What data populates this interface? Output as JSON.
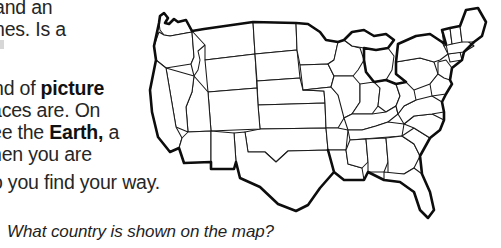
{
  "page": {
    "background_color": "#ffffff",
    "text_color": "#262626"
  },
  "passage": {
    "clipped_top_lines": [
      "and an",
      "nes. Is a"
    ],
    "lines": [
      {
        "id": "line-1",
        "segments": [
          {
            "text": "nd of ",
            "bold": false
          },
          {
            "text": "picture",
            "bold": true
          }
        ]
      },
      {
        "id": "line-2",
        "segments": [
          {
            "text": "aces are. On",
            "bold": false
          }
        ]
      },
      {
        "id": "line-3",
        "segments": [
          {
            "text": "ee the ",
            "bold": false
          },
          {
            "text": "Earth,",
            "bold": true
          },
          {
            "text": " a",
            "bold": false
          }
        ]
      },
      {
        "id": "line-4",
        "segments": [
          {
            "text": "hen you are",
            "bold": false
          }
        ]
      },
      {
        "id": "line-5",
        "segments": [
          {
            "text": "o you find your way.",
            "bold": false
          }
        ]
      }
    ],
    "line_top_1": "and an",
    "line_top_2": "nes. Is a",
    "line_1_a": "nd of ",
    "line_1_bold": "picture",
    "line_2": "aces are. On",
    "line_3_a": "ee the ",
    "line_3_bold": "Earth,",
    "line_3_b": " a",
    "line_4": "hen you are",
    "line_5": "o you find your way."
  },
  "question": {
    "text": "What country is shown on the map?",
    "style": "italic"
  },
  "map": {
    "subject": "United States of America",
    "description": "Outline map of the contiguous United States with state borders",
    "style": "black line art on white",
    "outline_color": "#0d0d0d",
    "border_color": "#1a1a1a",
    "fill_color": "#ffffff"
  }
}
